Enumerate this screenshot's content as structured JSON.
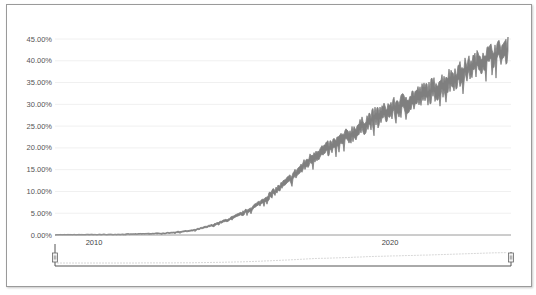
{
  "chart_data": {
    "type": "area",
    "title": "",
    "xlabel": "",
    "ylabel": "",
    "ylim": [
      0,
      45
    ],
    "yticks": [
      "0.00%",
      "5.00%",
      "10.00%",
      "15.00%",
      "20.00%",
      "25.00%",
      "30.00%",
      "35.00%",
      "40.00%",
      "45.00%"
    ],
    "xticks": [
      "2010",
      "2020"
    ],
    "grid": true,
    "legend": "none",
    "series": [
      {
        "name": "series",
        "color": "#7f7f7f",
        "x": [
          2008.0,
          2010,
          2011,
          2012,
          2013,
          2013.5,
          2014,
          2014.5,
          2015,
          2015.5,
          2016,
          2016.5,
          2017,
          2017.5,
          2018,
          2018.5,
          2019,
          2019.5,
          2020,
          2020.5,
          2021,
          2021.5,
          2022,
          2022.5,
          2023,
          2023.5,
          2024,
          2024.5
        ],
        "values": [
          0.0,
          0.1,
          0.2,
          0.4,
          1.0,
          1.8,
          2.8,
          4.0,
          5.5,
          7.5,
          10.0,
          12.5,
          15.5,
          18.5,
          20.0,
          22.0,
          24.0,
          26.5,
          28.0,
          29.5,
          31.0,
          32.5,
          34.0,
          36.0,
          38.0,
          40.0,
          41.5,
          42.5
        ]
      }
    ],
    "navigator": {
      "visible": true,
      "handles": [
        "left",
        "right"
      ]
    }
  }
}
